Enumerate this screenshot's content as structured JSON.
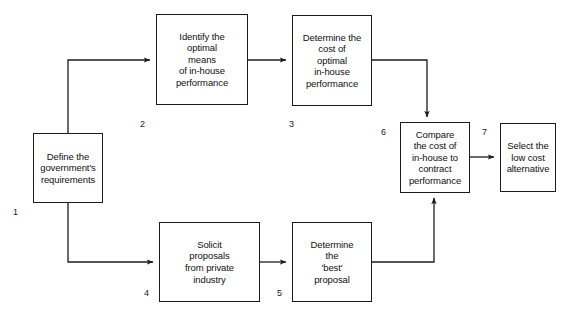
{
  "diagram": {
    "background_color": "#ffffff",
    "line_color": "#1c1c1c",
    "text_color": "#111111",
    "nodes": [
      {
        "id": "node-1",
        "number": "1",
        "text": "Define the\ngovernment's\nrequirements"
      },
      {
        "id": "node-2",
        "number": "2",
        "text": "Identify the\noptimal\nmeans\nof in-house\nperformance"
      },
      {
        "id": "node-3",
        "number": "3",
        "text": "Determine the\ncost of\noptimal\nin-house\nperformance"
      },
      {
        "id": "node-4",
        "number": "4",
        "text": "Solicit\nproposals\nfrom private\nindustry"
      },
      {
        "id": "node-5",
        "number": "5",
        "text": "Determine\nthe\n'best'\nproposal"
      },
      {
        "id": "node-6",
        "number": "6",
        "text": "Compare\nthe cost of\nin-house to\ncontract\nperformance"
      },
      {
        "id": "node-7",
        "number": "7",
        "text": "Select the\nlow cost\nalternative"
      }
    ],
    "connectors": [
      {
        "id": "connector-1-to-2",
        "from": "1",
        "to": "2"
      },
      {
        "id": "connector-2-to-3",
        "from": "2",
        "to": "3"
      },
      {
        "id": "connector-3-to-6",
        "from": "3",
        "to": "6"
      },
      {
        "id": "connector-1-to-4",
        "from": "1",
        "to": "4"
      },
      {
        "id": "connector-4-to-5",
        "from": "4",
        "to": "5"
      },
      {
        "id": "connector-5-to-6",
        "from": "5",
        "to": "6"
      },
      {
        "id": "connector-6-to-7",
        "from": "6",
        "to": "7"
      }
    ]
  }
}
